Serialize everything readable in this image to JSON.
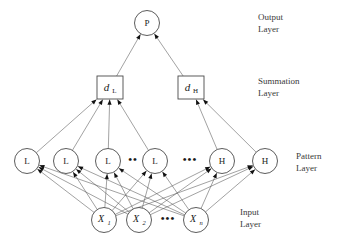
{
  "figure": {
    "background_color": "#ffffff",
    "stroke_color": "#555555",
    "node_fill": "#ffffff",
    "text_color": "#1a1a1a"
  },
  "layers": [
    {
      "id": "output",
      "caption_line1": "Output",
      "caption_line2": "Layer",
      "caption_x": 258,
      "caption_y1": 18,
      "caption_y2": 30
    },
    {
      "id": "summation",
      "caption_line1": "Summation",
      "caption_line2": "Layer",
      "caption_x": 258,
      "caption_y1": 82,
      "caption_y2": 94
    },
    {
      "id": "pattern",
      "caption_line1": "Pattern",
      "caption_line2": "Layer",
      "caption_x": 296,
      "caption_y1": 157,
      "caption_y2": 169
    },
    {
      "id": "input",
      "caption_line1": "Input",
      "caption_line2": "Layer",
      "caption_x": 240,
      "caption_y1": 213,
      "caption_y2": 225
    }
  ],
  "output_nodes": [
    {
      "id": "P",
      "label": "P",
      "cx": 147,
      "cy": 23,
      "r": 12.5
    }
  ],
  "summation_nodes": [
    {
      "id": "dL",
      "main": "d",
      "sub": "L",
      "x": 97,
      "y": 76,
      "w": 26,
      "h": 23
    },
    {
      "id": "dH",
      "main": "d",
      "sub": "H",
      "x": 178,
      "y": 76,
      "w": 26,
      "h": 23
    }
  ],
  "pattern_nodes": [
    {
      "id": "L1",
      "label": "L",
      "cx": 27,
      "cy": 161,
      "r": 12.5
    },
    {
      "id": "L2",
      "label": "L",
      "cx": 66,
      "cy": 161,
      "r": 12.5
    },
    {
      "id": "L3",
      "label": "L",
      "cx": 108,
      "cy": 161,
      "r": 12.5
    },
    {
      "id": "L4",
      "label": "L",
      "cx": 155,
      "cy": 161,
      "r": 12.5
    },
    {
      "id": "H1",
      "label": "H",
      "cx": 222,
      "cy": 161,
      "r": 12.5
    },
    {
      "id": "H2",
      "label": "H",
      "cx": 265,
      "cy": 161,
      "r": 12.5
    }
  ],
  "pattern_ellipses": [
    {
      "id": "dots-L",
      "text": "••",
      "x": 133,
      "y": 160
    },
    {
      "id": "dots-LH",
      "text": "•••",
      "x": 190,
      "y": 160
    }
  ],
  "input_nodes": [
    {
      "id": "X1",
      "main": "X",
      "sub": "1",
      "cx": 104,
      "cy": 220,
      "r": 12.5
    },
    {
      "id": "X2",
      "main": "X",
      "sub": "2",
      "cx": 139,
      "cy": 220,
      "r": 12.5
    },
    {
      "id": "Xn",
      "main": "X",
      "sub": "n",
      "cx": 196,
      "cy": 220,
      "r": 12.5
    }
  ],
  "input_ellipses": [
    {
      "id": "dots-X",
      "text": "•••",
      "x": 168,
      "y": 219
    }
  ],
  "edges": {
    "summation_to_output": [
      {
        "from": "dL",
        "to": "P"
      },
      {
        "from": "dH",
        "to": "P"
      }
    ],
    "pattern_to_summation": [
      {
        "from": "L1",
        "to": "dL"
      },
      {
        "from": "L2",
        "to": "dL"
      },
      {
        "from": "L3",
        "to": "dL"
      },
      {
        "from": "L4",
        "to": "dL"
      },
      {
        "from": "H1",
        "to": "dH"
      },
      {
        "from": "H2",
        "to": "dH"
      }
    ],
    "input_to_pattern": [
      {
        "from": "X1",
        "to": "L1"
      },
      {
        "from": "X1",
        "to": "L2"
      },
      {
        "from": "X1",
        "to": "L3"
      },
      {
        "from": "X1",
        "to": "L4"
      },
      {
        "from": "X1",
        "to": "H1"
      },
      {
        "from": "X1",
        "to": "H2"
      },
      {
        "from": "X2",
        "to": "L1"
      },
      {
        "from": "X2",
        "to": "L2"
      },
      {
        "from": "X2",
        "to": "L3"
      },
      {
        "from": "X2",
        "to": "L4"
      },
      {
        "from": "X2",
        "to": "H1"
      },
      {
        "from": "X2",
        "to": "H2"
      },
      {
        "from": "Xn",
        "to": "L1"
      },
      {
        "from": "Xn",
        "to": "L2"
      },
      {
        "from": "Xn",
        "to": "L3"
      },
      {
        "from": "Xn",
        "to": "L4"
      },
      {
        "from": "Xn",
        "to": "H1"
      },
      {
        "from": "Xn",
        "to": "H2"
      }
    ]
  }
}
